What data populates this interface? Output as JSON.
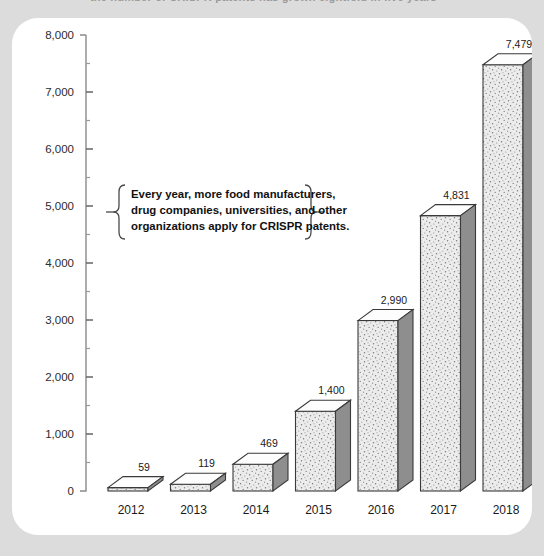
{
  "page": {
    "background_color": "#dcdcdc",
    "card_color": "#ffffff",
    "clipped_headline": "the number of CRISPR patents has grown                   eightfold in five years"
  },
  "chart_data": {
    "type": "bar",
    "title": "",
    "subtitle": "",
    "xlabel": "",
    "ylabel": "",
    "categories": [
      "2012",
      "2013",
      "2014",
      "2015",
      "2016",
      "2017",
      "2018"
    ],
    "values": [
      59,
      119,
      469,
      1400,
      2990,
      4831,
      7479
    ],
    "value_labels": [
      "59",
      "119",
      "469",
      "1,400",
      "2,990",
      "4,831",
      "7,479"
    ],
    "ylim": [
      0,
      8000
    ],
    "ytick_values": [
      0,
      1000,
      2000,
      3000,
      4000,
      5000,
      6000,
      7000,
      8000
    ],
    "ytick_labels": [
      "0",
      "1,000",
      "2,000",
      "3,000",
      "4,000",
      "5,000",
      "6,000",
      "7,000",
      "8,000"
    ],
    "minor_ticks": true,
    "grid": false,
    "legend": "none",
    "series": [
      {
        "name": "CRISPR patent applications",
        "values": [
          59,
          119,
          469,
          1400,
          2990,
          4831,
          7479
        ]
      }
    ],
    "annotations": [
      {
        "name": "callout",
        "lines": [
          "Every year, more food manufacturers,",
          "drug companies, universities, and other",
          "organizations apply for CRISPR patents."
        ]
      }
    ],
    "style": {
      "bar_render": "3d-isometric",
      "front_face_color": "#ededed",
      "top_face_color": "#fdfdfd",
      "side_face_color": "#8e8e8e",
      "outline_color": "#3a3a3a",
      "axis_color": "#8a8a8a"
    }
  }
}
